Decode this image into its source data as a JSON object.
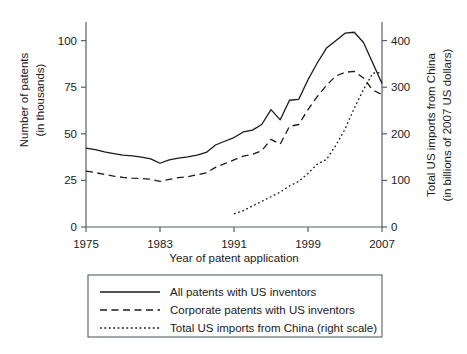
{
  "chart_data": {
    "type": "line",
    "title": "",
    "xlabel": "Year of patent application",
    "ylabel": "Number of patents\n(in thousands)",
    "ylabel_line1": "Number of patents",
    "ylabel_line2": "(in thousands)",
    "y2label_line1": "Total US imports from China",
    "y2label_line2": "(in billions of 2007 US dollars)",
    "xlim": [
      1975,
      2007
    ],
    "ylim": [
      0,
      110
    ],
    "y2lim": [
      0,
      440
    ],
    "grid": false,
    "legend_position": "below",
    "xticks": [
      1975,
      1983,
      1991,
      1999,
      2007
    ],
    "xtick_labels": [
      "1975",
      "1983",
      "1991",
      "1999",
      "2007"
    ],
    "yticks": [
      0,
      25,
      50,
      75,
      100
    ],
    "ytick_labels": [
      "0",
      "25",
      "50",
      "75",
      "100"
    ],
    "y2ticks": [
      0,
      100,
      200,
      300,
      400
    ],
    "y2tick_labels": [
      "0",
      "100",
      "200",
      "300",
      "400"
    ],
    "series": [
      {
        "name": "All patents with US inventors",
        "style": "solid",
        "axis": "left",
        "x": [
          1975,
          1976,
          1977,
          1978,
          1979,
          1980,
          1981,
          1982,
          1983,
          1984,
          1985,
          1986,
          1987,
          1988,
          1989,
          1990,
          1991,
          1992,
          1993,
          1994,
          1995,
          1996,
          1997,
          1998,
          1999,
          2000,
          2001,
          2002,
          2003,
          2004,
          2005,
          2006,
          2007
        ],
        "values": [
          42.3,
          41.5,
          40.3,
          39.4,
          38.6,
          38.2,
          37.5,
          36.6,
          34.2,
          36.0,
          37.0,
          37.6,
          38.6,
          40.0,
          44.0,
          46.0,
          48.0,
          51.0,
          52.0,
          55.0,
          63.0,
          57.5,
          68.0,
          68.5,
          79.0,
          88.0,
          96.0,
          100.0,
          104.0,
          104.5,
          99.0,
          88.0,
          77.0
        ]
      },
      {
        "name": "Corporate patents with US inventors",
        "style": "dashed",
        "axis": "left",
        "x": [
          1975,
          1976,
          1977,
          1978,
          1979,
          1980,
          1981,
          1982,
          1983,
          1984,
          1985,
          1986,
          1987,
          1988,
          1989,
          1990,
          1991,
          1992,
          1993,
          1994,
          1995,
          1996,
          1997,
          1998,
          1999,
          2000,
          2001,
          2002,
          2003,
          2004,
          2005,
          2006,
          2007
        ],
        "values": [
          30.0,
          29.2,
          28.2,
          27.3,
          26.6,
          26.2,
          26.0,
          25.6,
          24.5,
          25.5,
          26.5,
          27.0,
          28.0,
          29.0,
          32.0,
          34.0,
          36.0,
          38.0,
          39.0,
          41.0,
          47.0,
          44.5,
          54.0,
          55.0,
          63.0,
          70.0,
          76.0,
          81.0,
          83.0,
          83.5,
          80.0,
          73.5,
          71.0
        ]
      },
      {
        "name": "Total US imports from China (right scale)",
        "style": "dotted",
        "axis": "right",
        "x": [
          1991,
          1992,
          1993,
          1994,
          1995,
          1996,
          1997,
          1998,
          1999,
          2000,
          2001,
          2002,
          2003,
          2004,
          2005,
          2006,
          2007
        ],
        "values": [
          28,
          35,
          45,
          55,
          65,
          75,
          88,
          98,
          115,
          135,
          145,
          175,
          210,
          255,
          295,
          330,
          332
        ]
      }
    ]
  },
  "legend": {
    "entries": [
      {
        "label": "All patents with US inventors",
        "style": "solid"
      },
      {
        "label": "Corporate patents with US inventors",
        "style": "dashed"
      },
      {
        "label": "Total US imports from China (right scale)",
        "style": "dotted"
      }
    ]
  }
}
